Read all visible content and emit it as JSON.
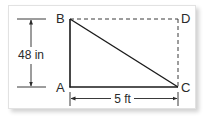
{
  "diagram": {
    "type": "right-triangle-in-rectangle",
    "points": {
      "A": {
        "label": "A"
      },
      "B": {
        "label": "B"
      },
      "C": {
        "label": "C"
      },
      "D": {
        "label": "D"
      }
    },
    "dimensions": {
      "vertical": {
        "label": "48 in",
        "segment": "AB"
      },
      "horizontal": {
        "label": "5 ft",
        "segment": "AC"
      }
    },
    "edges": {
      "solid": [
        "AB",
        "AC",
        "BC"
      ],
      "dashed": [
        "BD",
        "DC"
      ]
    },
    "colors": {
      "line": "#1a1a1a",
      "dimension": "#3a3a3a",
      "frame_border": "#e2e2e2",
      "background": "#ffffff"
    }
  }
}
